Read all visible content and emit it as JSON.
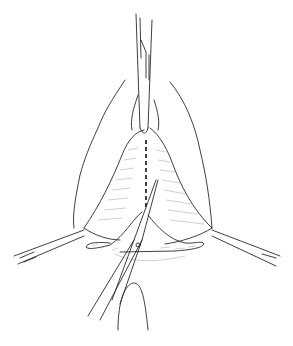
{
  "figure": {
    "type": "surgical line illustration",
    "background": "#ffffff",
    "stroke_color": "#2a2a2a",
    "elements": [
      "forceps-top",
      "tissue-triangle",
      "incision-dashed-line",
      "clamp-left",
      "clamp-right",
      "scissors",
      "finger",
      "outer-contours"
    ]
  }
}
